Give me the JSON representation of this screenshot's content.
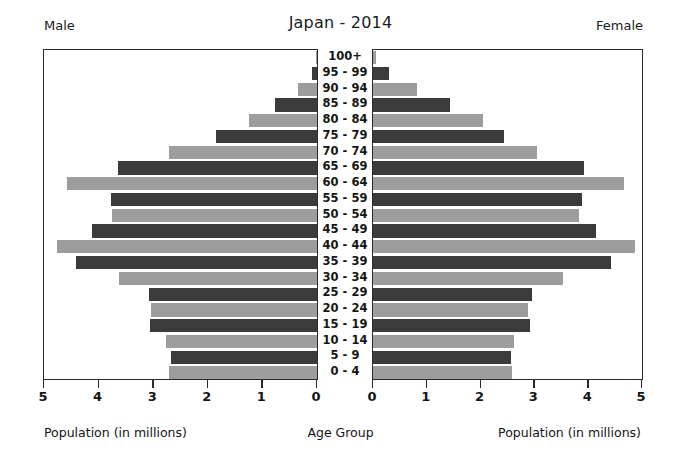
{
  "header": {
    "title": "Japan - 2014",
    "left_label": "Male",
    "right_label": "Female"
  },
  "captions": {
    "left": "Population (in millions)",
    "center": "Age Group",
    "right": "Population (in millions)"
  },
  "axes": {
    "left_ticks": [
      "5",
      "4",
      "3",
      "2",
      "1",
      "0"
    ],
    "right_ticks": [
      "0",
      "1",
      "2",
      "3",
      "4",
      "5"
    ]
  },
  "chart_data": {
    "type": "bar",
    "title": "Japan - 2014",
    "subtitle": "",
    "xlabel": "Population (in millions)",
    "ylabel": "Age Group",
    "orientation": "horizontal",
    "layout": "population-pyramid",
    "grid": false,
    "legend_position": "none",
    "xlim": [
      0,
      5
    ],
    "left_axis_reversed": true,
    "colors": {
      "dark_bar": "#3b3b3b",
      "light_bar": "#9d9d9d",
      "frame": "#2b2b2b",
      "background": "#ffffff"
    },
    "categories": [
      "100+",
      "95 - 99",
      "90 - 94",
      "85 - 89",
      "80 - 84",
      "75 - 79",
      "70 - 74",
      "65 - 69",
      "60 - 64",
      "55 - 59",
      "50 - 54",
      "45 - 49",
      "40 - 44",
      "35 - 39",
      "30 - 34",
      "25 - 29",
      "20 - 24",
      "15 - 19",
      "10 - 14",
      "5 - 9",
      "0 - 4"
    ],
    "series": [
      {
        "name": "Male",
        "side": "left",
        "values": [
          0.01,
          0.09,
          0.35,
          0.77,
          1.25,
          1.85,
          2.72,
          3.64,
          4.57,
          3.78,
          3.75,
          4.12,
          4.77,
          4.42,
          3.62,
          3.07,
          3.04,
          3.06,
          2.77,
          2.68,
          2.72
        ]
      },
      {
        "name": "Female",
        "side": "right",
        "values": [
          0.05,
          0.29,
          0.82,
          1.44,
          2.04,
          2.43,
          3.05,
          3.93,
          4.66,
          3.88,
          3.83,
          4.15,
          4.87,
          4.42,
          3.54,
          2.96,
          2.89,
          2.91,
          2.63,
          2.56,
          2.59
        ]
      }
    ]
  }
}
